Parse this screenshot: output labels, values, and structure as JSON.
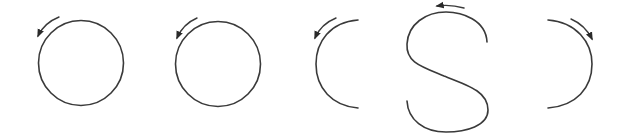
{
  "diagram": {
    "colors": {
      "stroke": "#3a3a3a",
      "background": "#ffffff"
    },
    "shapes": [
      {
        "id": "circle-1",
        "kind": "circle",
        "arrow_direction": "counter-clockwise"
      },
      {
        "id": "circle-2",
        "kind": "circle",
        "arrow_direction": "counter-clockwise"
      },
      {
        "id": "left-arc",
        "kind": "open-arc-left",
        "arrow_direction": "counter-clockwise"
      },
      {
        "id": "s-curve",
        "kind": "s-shape",
        "arrow_direction": "right-to-left"
      },
      {
        "id": "right-arc",
        "kind": "open-arc-right",
        "arrow_direction": "clockwise"
      }
    ]
  }
}
